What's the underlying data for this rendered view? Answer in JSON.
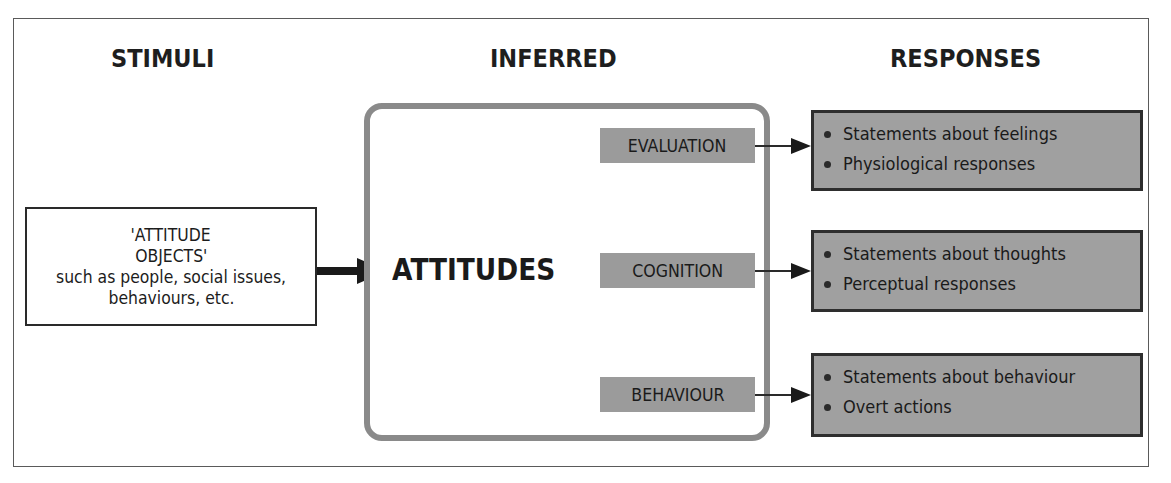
{
  "headers": {
    "stimuli": "STIMULI",
    "inferred": "INFERRED",
    "responses": "RESPONSES"
  },
  "stimulus_box": {
    "lines": [
      "'ATTITUDE",
      "OBJECTS'",
      "such as people, social issues,",
      "behaviours, etc."
    ]
  },
  "central_concept": "ATTITUDES",
  "components": [
    {
      "label": "EVALUATION",
      "responses": [
        "Statements about feelings",
        "Physiological responses"
      ]
    },
    {
      "label": "COGNITION",
      "responses": [
        "Statements about thoughts",
        "Perceptual responses"
      ]
    },
    {
      "label": "BEHAVIOUR",
      "responses": [
        "Statements about behaviour",
        "Overt actions"
      ]
    }
  ],
  "colors": {
    "label_fill": "#9b9b9b",
    "response_fill": "#a0a0a0",
    "inferred_border": "#8a8a8a",
    "text": "#1a1a1a"
  }
}
